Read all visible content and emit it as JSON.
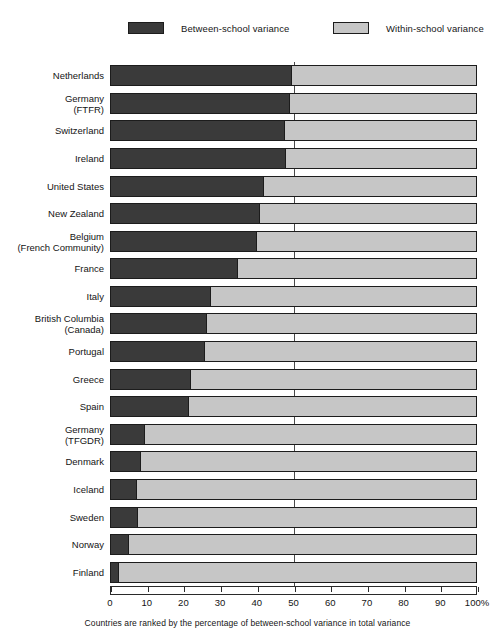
{
  "legend": {
    "items": [
      {
        "label": "Between-school variance",
        "color": "#3a3a3a",
        "swatch": "dark"
      },
      {
        "label": "Within-school variance",
        "color": "#c6c6c6",
        "swatch": "light"
      }
    ]
  },
  "caption": "Countries are ranked by the percentage of between-school variance in total variance",
  "axis": {
    "tick_labels": [
      "0",
      "10",
      "20",
      "30",
      "40",
      "50",
      "60",
      "70",
      "80",
      "90",
      "100%"
    ],
    "ticks": [
      0,
      10,
      20,
      30,
      40,
      50,
      60,
      70,
      80,
      90,
      100
    ],
    "gridline_at": 50
  },
  "chart_data": {
    "type": "bar",
    "orientation": "horizontal",
    "stacked": true,
    "stack_total": 100,
    "title": "",
    "subtitle": "",
    "xlabel": "",
    "ylabel": "",
    "xlim": [
      0,
      100
    ],
    "grid": true,
    "legend_position": "top",
    "note": "Countries are ranked by the percentage of between-school variance in total variance",
    "categories": [
      "Netherlands",
      "Germany\n(FTFR)",
      "Switzerland",
      "Ireland",
      "United States",
      "New Zealand",
      "Belgium\n(French Community)",
      "France",
      "Italy",
      "British Columbia\n(Canada)",
      "Portugal",
      "Greece",
      "Spain",
      "Germany\n(TFGDR)",
      "Denmark",
      "Iceland",
      "Sweden",
      "Norway",
      "Finland"
    ],
    "series": [
      {
        "name": "Between-school variance",
        "color": "#3a3a3a",
        "values": [
          49.5,
          49.0,
          47.7,
          48.0,
          42.0,
          41.0,
          40.0,
          35.0,
          27.5,
          26.5,
          26.0,
          22.0,
          21.5,
          9.5,
          8.5,
          7.4,
          7.6,
          5.2,
          2.5
        ]
      },
      {
        "name": "Within-school variance",
        "color": "#c6c6c6",
        "values": [
          50.5,
          51.0,
          52.3,
          52.0,
          58.0,
          59.0,
          60.0,
          65.0,
          72.5,
          73.5,
          74.0,
          78.0,
          78.5,
          90.5,
          91.5,
          92.6,
          92.4,
          94.8,
          97.5
        ]
      }
    ]
  }
}
